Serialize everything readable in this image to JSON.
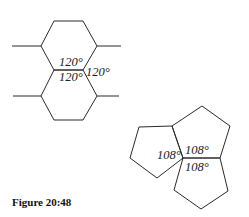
{
  "figure": {
    "caption": "Figure 20:48"
  },
  "hexagons": {
    "angles": [
      {
        "label": "120°",
        "x": 59,
        "y": 66
      },
      {
        "label": "120°",
        "x": 59,
        "y": 81
      },
      {
        "label": "120°",
        "x": 86,
        "y": 76
      }
    ]
  },
  "pentagons": {
    "angles": [
      {
        "label": "108°",
        "x": 157,
        "y": 159
      },
      {
        "label": "108°",
        "x": 185,
        "y": 154
      },
      {
        "label": "108°",
        "x": 185,
        "y": 171
      }
    ]
  }
}
